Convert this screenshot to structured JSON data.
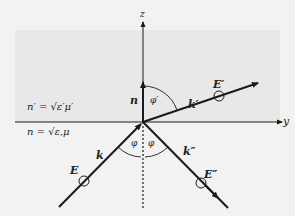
{
  "diagram": {
    "title": "",
    "colors": {
      "background": "#f2f2f2",
      "upper_medium_shade": "#e8e8e8",
      "lines": "#1a1a1a"
    },
    "axes": {
      "z_label": "z",
      "y_label": "y"
    },
    "media": {
      "upper": "n′ = √ε′μ′",
      "lower": "n = √ε,μ"
    },
    "vectors": {
      "normal": "n",
      "incident_wave": "k",
      "refracted_wave": "k′",
      "reflected_wave": "k″"
    },
    "fields": {
      "incident": "E",
      "refracted": "E′",
      "reflected": "E″"
    },
    "angles": {
      "incidence": "φ",
      "reflection": "φ",
      "refraction": "φ′"
    }
  }
}
